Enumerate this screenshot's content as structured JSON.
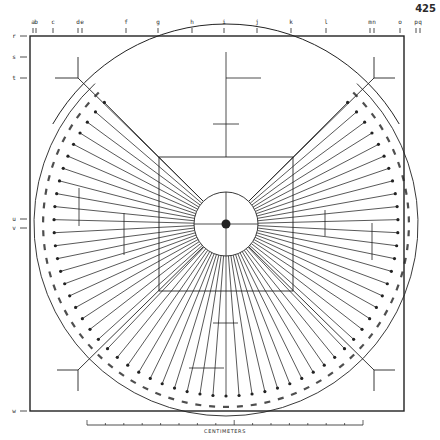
{
  "page": {
    "number": "425"
  },
  "colors": {
    "ink": "#222222",
    "paper": "#ffffff"
  },
  "top_ticks": [
    {
      "label": "a",
      "x": 33
    },
    {
      "label": "b",
      "x": 36
    },
    {
      "label": "c",
      "x": 53
    },
    {
      "label": "d",
      "x": 78
    },
    {
      "label": "e",
      "x": 82
    },
    {
      "label": "f",
      "x": 126
    },
    {
      "label": "g",
      "x": 158
    },
    {
      "label": "h",
      "x": 192
    },
    {
      "label": "i",
      "x": 224
    },
    {
      "label": "j",
      "x": 257
    },
    {
      "label": "k",
      "x": 291
    },
    {
      "label": "l",
      "x": 326
    },
    {
      "label": "m",
      "x": 370
    },
    {
      "label": "n",
      "x": 374
    },
    {
      "label": "o",
      "x": 400
    },
    {
      "label": "p",
      "x": 416
    },
    {
      "label": "q",
      "x": 420
    }
  ],
  "left_ticks": [
    {
      "label": "r",
      "y": 36
    },
    {
      "label": "s",
      "y": 57
    },
    {
      "label": "t",
      "y": 78
    },
    {
      "label": "u",
      "y": 219
    },
    {
      "label": "v",
      "y": 228
    },
    {
      "label": "w",
      "y": 411
    }
  ],
  "scale": {
    "caption": "CENTIMETERS",
    "x_start": 87,
    "x_end": 363,
    "y": 425,
    "divisions": 15
  },
  "geometry": {
    "frame": {
      "x1": 30,
      "y1": 36,
      "x2": 404,
      "y2": 411
    },
    "center": {
      "x": 226,
      "y": 224
    },
    "inner_circle_r": 32,
    "square": {
      "x1": 159,
      "y1": 157,
      "x2": 293,
      "y2": 291
    },
    "outer_circle_r": 200,
    "spoke_end_r": 172,
    "band_inner_r": 178,
    "band_outer_r": 192,
    "spoke_count": 63,
    "spoke_angle_start_deg": 135,
    "spoke_angle_end_deg": -135
  },
  "annotations": {
    "band_glyph": "⌁"
  }
}
